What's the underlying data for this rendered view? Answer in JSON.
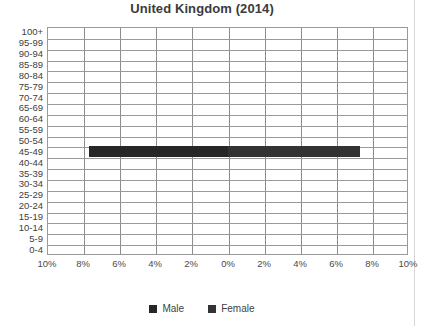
{
  "chart_data": {
    "type": "bar",
    "title": "United Kingdom (2014)",
    "subtitle": "",
    "xlabel": "",
    "ylabel": "",
    "orientation": "horizontal",
    "layout": "population-pyramid",
    "grid": true,
    "legend_position": "bottom",
    "axis_center_value": "0%",
    "xlim": [
      -10,
      10
    ],
    "x_tick_labels": [
      "10%",
      "8%",
      "6%",
      "4%",
      "2%",
      "0%",
      "2%",
      "4%",
      "6%",
      "8%",
      "10%"
    ],
    "x_tick_values": [
      -10,
      -8,
      -6,
      -4,
      -2,
      0,
      2,
      4,
      6,
      8,
      10
    ],
    "categories": [
      "0-4",
      "5-9",
      "10-14",
      "15-19",
      "20-24",
      "25-29",
      "30-34",
      "35-39",
      "40-44",
      "45-49",
      "50-54",
      "55-59",
      "60-64",
      "65-69",
      "70-74",
      "75-79",
      "80-84",
      "85-89",
      "90-94",
      "95-99",
      "100+"
    ],
    "series": [
      {
        "name": "Male",
        "color": "#262626",
        "side": "left",
        "values": [
          0,
          0,
          0,
          0,
          0,
          0,
          0,
          0,
          0,
          7.7,
          0,
          0,
          0,
          0,
          0,
          0,
          0,
          0,
          0,
          0,
          0
        ]
      },
      {
        "name": "Female",
        "color": "#333333",
        "side": "right",
        "values": [
          0,
          0,
          0,
          0,
          0,
          0,
          0,
          0,
          0,
          7.3,
          0,
          0,
          0,
          0,
          0,
          0,
          0,
          0,
          0,
          0,
          0
        ]
      }
    ]
  },
  "legend": {
    "items": [
      {
        "label": "Male",
        "color": "#262626"
      },
      {
        "label": "Female",
        "color": "#333333"
      }
    ]
  }
}
